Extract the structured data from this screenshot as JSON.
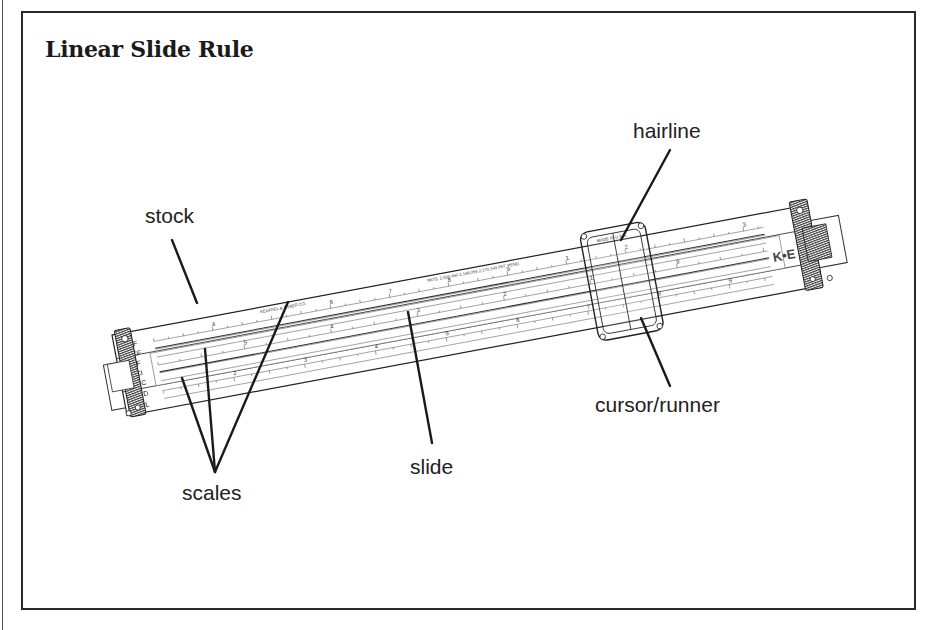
{
  "title": "Linear Slide Rule",
  "labels": {
    "stock": "stock",
    "hairline": "hairline",
    "cursor": "cursor/runner",
    "slide": "slide",
    "scales": "scales"
  },
  "rule": {
    "maker_stamp": "KEUFFEL & ESSER CO.",
    "patent_stamp": "PATS. 2,500,460  2,168,056  2,170,144  PAT. PEND.",
    "cursor_stamp": "MADE IN U.S.A.",
    "logo": "K•E",
    "model": "4070-3",
    "scale_names": [
      "DF",
      "CF",
      "CIF",
      "CI",
      "C",
      "D",
      "L"
    ]
  },
  "colors": {
    "ink": "#222222",
    "frame": "#2a2a2a",
    "background": "#ffffff",
    "hatch": "#3a3a3a"
  }
}
